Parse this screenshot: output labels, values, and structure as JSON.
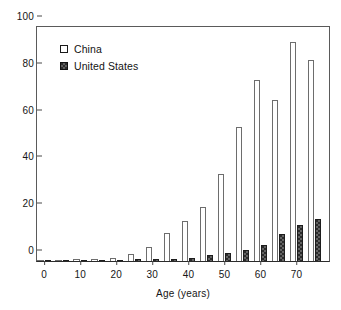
{
  "chart_data": {
    "type": "bar",
    "title": "",
    "subtitle": "",
    "xlabel": "Age (years)",
    "ylabel": "",
    "xlim": [
      -2,
      79
    ],
    "ylim": [
      0,
      100
    ],
    "grid": false,
    "legend_position": "top-left",
    "x_ticks": [
      0,
      10,
      20,
      30,
      40,
      50,
      60,
      70
    ],
    "x_tick_labels": [
      "0",
      "10",
      "20",
      "30",
      "40",
      "50",
      "60",
      "70"
    ],
    "y_ticks": [
      0,
      20,
      40,
      60,
      80,
      100
    ],
    "y_tick_labels": [
      "0",
      "20",
      "40",
      "60",
      "80",
      "100"
    ],
    "categories": [
      0,
      5,
      10,
      15,
      20,
      25,
      30,
      35,
      40,
      45,
      50,
      55,
      60,
      65,
      70,
      75
    ],
    "category_labels": [
      "0",
      "5",
      "10",
      "15",
      "20",
      "25",
      "30",
      "35",
      "40",
      "45",
      "50",
      "55",
      "60",
      "65",
      "70",
      "75"
    ],
    "series": [
      {
        "name": "China",
        "color": "#ffffff",
        "edge_color": "#6d6d6d",
        "values": [
          0.5,
          0.6,
          0.7,
          1.0,
          1.4,
          3.2,
          5.9,
          12.0,
          17.2,
          22.9,
          37.3,
          57.4,
          77.4,
          68.7,
          93.8,
          85.7
        ]
      },
      {
        "name": "United States",
        "color": "#2c2c2c",
        "edge_color": "#1d1d1d",
        "values": [
          0.4,
          0.3,
          0.3,
          0.5,
          0.6,
          0.7,
          0.8,
          0.9,
          1.5,
          2.4,
          3.6,
          4.8,
          6.8,
          11.4,
          15.5,
          17.8
        ]
      }
    ]
  },
  "legend": {
    "items": [
      {
        "label": "China",
        "swatch": "open-square-swatch"
      },
      {
        "label": "United States",
        "swatch": "filled-square-swatch"
      }
    ]
  },
  "axes": {
    "x_title": "Age (years)"
  }
}
